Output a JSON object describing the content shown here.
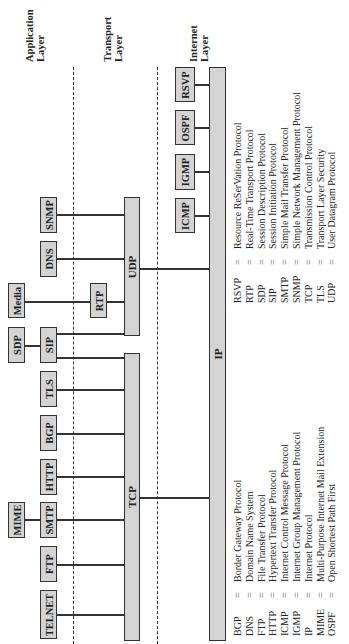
{
  "layers": {
    "application": "Application Layer",
    "transport": "Transport Layer",
    "internet": "Internet Layer"
  },
  "protocols": {
    "ip": "IP",
    "tcp": "TCP",
    "udp": "UDP",
    "rtp": "RTP",
    "rsvp": "RSVP",
    "ospf": "OSPF",
    "igmp": "IGMP",
    "icmp": "ICMP",
    "snmp": "SNMP",
    "dns": "DNS",
    "media": "Media",
    "sdp": "SDP",
    "sip": "SIP",
    "tls": "TLS",
    "bgp": "BGP",
    "http": "HTTP",
    "smtp": "SMTP",
    "mime": "MIME",
    "ftp": "FTP",
    "telnet": "TELNET"
  },
  "legend_left": [
    {
      "abbr": "BGP",
      "eq": "=",
      "name": "Border Gateway Protocol"
    },
    {
      "abbr": "DNS",
      "eq": "=",
      "name": "Domain Name System"
    },
    {
      "abbr": "FTP",
      "eq": "=",
      "name": "File Transfer Protocol"
    },
    {
      "abbr": "HTTP",
      "eq": "=",
      "name": "Hypertext Transfer Protocol"
    },
    {
      "abbr": "ICMP",
      "eq": "=",
      "name": "Internet Control Message Protocol"
    },
    {
      "abbr": "IGMP",
      "eq": "=",
      "name": "Internet Group Management Protocol"
    },
    {
      "abbr": "IP",
      "eq": "=",
      "name": "Internet Protocol"
    },
    {
      "abbr": "MIME",
      "eq": "=",
      "name": "Multi-Purpose Internet Mail Extension"
    },
    {
      "abbr": "OSPF",
      "eq": "=",
      "name": "Open Shortest Path First"
    }
  ],
  "legend_right": [
    {
      "abbr": "RSVP",
      "eq": "=",
      "name": "Resource ReSerVation Protocol"
    },
    {
      "abbr": "RTP",
      "eq": "=",
      "name": "Real-Time Transport Protocol"
    },
    {
      "abbr": "SDP",
      "eq": "=",
      "name": "Session Description Protocol"
    },
    {
      "abbr": "SIP",
      "eq": "=",
      "name": "Session Initiation Protocol"
    },
    {
      "abbr": "SMTP",
      "eq": "=",
      "name": "Simple Mail Transfer Protocol"
    },
    {
      "abbr": "SNMP",
      "eq": "=",
      "name": "Simple Network Management Protocol"
    },
    {
      "abbr": "TCP",
      "eq": "=",
      "name": "Transmission Control Protocol"
    },
    {
      "abbr": "TLS",
      "eq": "=",
      "name": "Transport Layer Security"
    },
    {
      "abbr": "UDP",
      "eq": "=",
      "name": "User Datagram Protocol"
    }
  ]
}
